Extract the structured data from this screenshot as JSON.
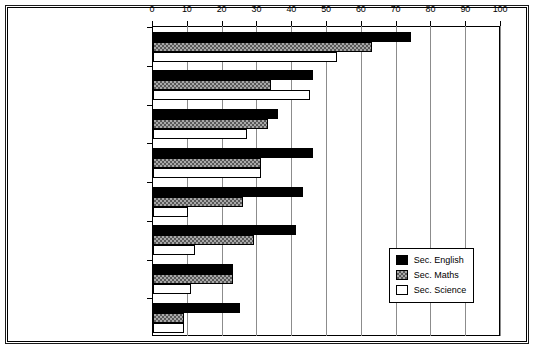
{
  "chart_data": {
    "type": "bar",
    "orientation": "horizontal",
    "title": "",
    "subtitle": "",
    "xlabel": "",
    "ylabel": "",
    "xlim": [
      0,
      100
    ],
    "xticks": [
      0,
      10,
      20,
      30,
      40,
      50,
      60,
      70,
      80,
      90,
      100
    ],
    "xtick_labels": [
      "0",
      "10",
      "20",
      "30",
      "40",
      "50",
      "60",
      "70",
      "80",
      "90",
      "100"
    ],
    "grid": true,
    "grid_axis": "x",
    "legend_position": "lower-right-inside",
    "categories": [
      "Responding flexibly",
      "Common task, varied materials",
      "Common task, differing targets",
      "Common task, varied modes",
      "Using assessments",
      "Individual targets",
      "Different tasks",
      "Varying purposes"
    ],
    "category_label_lines": [
      [
        "Responding flexibly"
      ],
      [
        "Common task,",
        "varied materials"
      ],
      [
        "Common task,",
        "differing targets"
      ],
      [
        "Common task, varied modes"
      ],
      [
        "Using assessments"
      ],
      [
        "Individual targets"
      ],
      [
        "Different tasks"
      ],
      [
        "Varying purposes"
      ]
    ],
    "series": [
      {
        "name": "Sec. English",
        "fill": "solid-black",
        "color": "#000000",
        "values": [
          74,
          46,
          36,
          46,
          43,
          41,
          23,
          25
        ]
      },
      {
        "name": "Sec. Maths",
        "fill": "checkered-grey",
        "color": "#a8a8a8",
        "values": [
          63,
          34,
          33,
          31,
          26,
          29,
          23,
          9
        ]
      },
      {
        "name": "Sec. Science",
        "fill": "white-outline",
        "color": "#ffffff",
        "values": [
          53,
          45,
          27,
          31,
          10,
          12,
          11,
          9
        ]
      }
    ]
  },
  "legend": {
    "items": [
      {
        "label": "Sec. English",
        "fill": "english"
      },
      {
        "label": "Sec. Maths",
        "fill": "maths"
      },
      {
        "label": "Sec. Science",
        "fill": "science"
      }
    ]
  }
}
